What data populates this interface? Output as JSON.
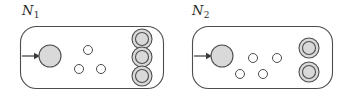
{
  "figure": {
    "type": "diagram",
    "background_color": "#ffffff",
    "stroke_color": "#4d4d4d",
    "state_fill_color": "#d9d9d9",
    "small_state_fill_color": "#ffffff",
    "label_color": "#2b2b2b"
  },
  "machines": [
    {
      "id": "n1",
      "label_base": "N",
      "label_sub": "1",
      "label_x": 22,
      "label_y": 4,
      "box": {
        "x": 20,
        "y": 26,
        "width": 143,
        "height": 62,
        "radius": 16
      },
      "arrow": {
        "x1": 22,
        "y1": 56,
        "x2": 38,
        "y2": 56
      },
      "start_state": {
        "cx": 50,
        "cy": 56,
        "r": 11
      },
      "plain_states": [
        {
          "cx": 88,
          "cy": 50,
          "r": 4.5
        },
        {
          "cx": 79,
          "cy": 69,
          "r": 4.5
        },
        {
          "cx": 101,
          "cy": 69,
          "r": 4.5
        }
      ],
      "accept_states": [
        {
          "cx": 142,
          "cy": 39,
          "r_outer": 10,
          "r_inner": 6.5
        },
        {
          "cx": 142,
          "cy": 57,
          "r_outer": 10,
          "r_inner": 6.5
        },
        {
          "cx": 142,
          "cy": 76,
          "r_outer": 10,
          "r_inner": 6.5
        }
      ]
    },
    {
      "id": "n2",
      "label_base": "N",
      "label_sub": "2",
      "label_x": 192,
      "label_y": 4,
      "box": {
        "x": 192,
        "y": 26,
        "width": 140,
        "height": 62,
        "radius": 16
      },
      "arrow": {
        "x1": 194,
        "y1": 56,
        "x2": 210,
        "y2": 56
      },
      "start_state": {
        "cx": 222,
        "cy": 56,
        "r": 11
      },
      "plain_states": [
        {
          "cx": 253,
          "cy": 58,
          "r": 4.5
        },
        {
          "cx": 277,
          "cy": 58,
          "r": 4.5
        },
        {
          "cx": 240,
          "cy": 74,
          "r": 4.5
        },
        {
          "cx": 263,
          "cy": 74,
          "r": 4.5
        }
      ],
      "accept_states": [
        {
          "cx": 309,
          "cy": 48,
          "r_outer": 10,
          "r_inner": 6.5
        },
        {
          "cx": 309,
          "cy": 72,
          "r_outer": 10,
          "r_inner": 6.5
        }
      ]
    }
  ]
}
